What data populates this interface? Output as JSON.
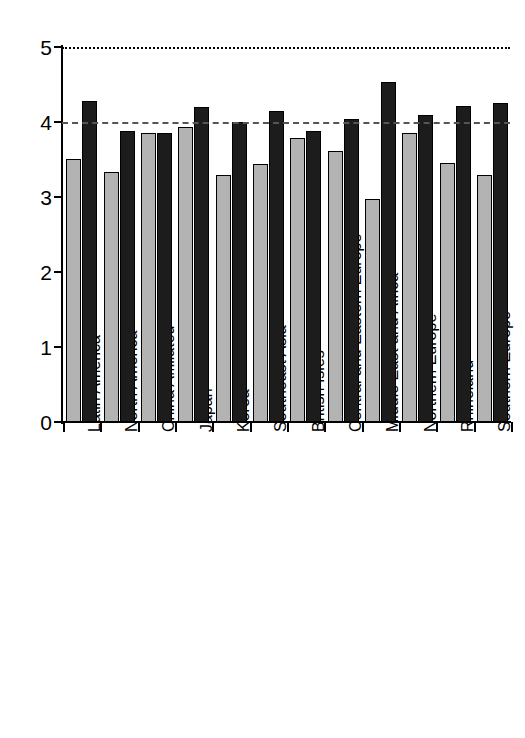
{
  "chart_data": {
    "type": "bar",
    "title": "",
    "subtitle": "",
    "xlabel": "",
    "ylabel": "",
    "ylim": [
      0,
      5
    ],
    "yticks": [
      0,
      1,
      2,
      3,
      4,
      5
    ],
    "ytick_labels": [
      "0",
      "1",
      "2",
      "3",
      "4",
      "5"
    ],
    "grid": false,
    "legend": "none",
    "categories": [
      "Latin America",
      "North America",
      "China Affiliated",
      "Japan",
      "Korea",
      "Southeast Asia",
      "British Isles",
      "Central and Eastern Europe",
      "Middle East and Africa",
      "Northern Europe",
      "Rhineland",
      "Southern Europe"
    ],
    "series": [
      {
        "name": "light-series",
        "color": "#b3b3b3",
        "values": [
          3.51,
          3.34,
          3.85,
          3.94,
          3.3,
          3.44,
          3.79,
          3.62,
          2.98,
          3.85,
          3.46,
          3.29
        ]
      },
      {
        "name": "dark-series",
        "color": "#1c1c1c",
        "values": [
          4.28,
          3.88,
          3.85,
          4.2,
          4.0,
          4.15,
          3.88,
          4.04,
          4.53,
          4.1,
          4.22,
          4.25
        ]
      }
    ],
    "reference_lines": [
      {
        "name": "upper-reference-line",
        "value": 5,
        "style": "dotted",
        "color": "#000000"
      },
      {
        "name": "mid-reference-line",
        "value": 4,
        "style": "dashed",
        "color": "#555555"
      }
    ]
  }
}
